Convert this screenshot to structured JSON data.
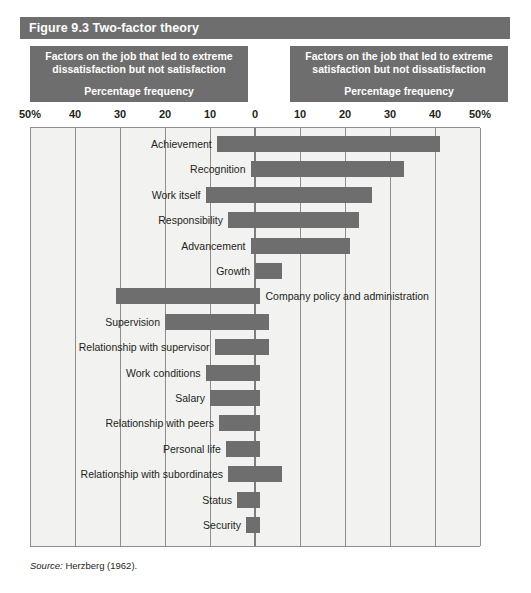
{
  "figure": {
    "title": "Figure 9.3 Two-factor theory",
    "source_prefix": "Source:",
    "source_text": " Herzberg (1962)."
  },
  "captions": {
    "left": {
      "line1": "Factors on the job that led to extreme",
      "line2": "dissatisfaction but not satisfaction",
      "sub": "Percentage frequency"
    },
    "right": {
      "line1": "Factors on the job that led to extreme",
      "line2": "satisfaction but not dissatisfaction",
      "sub": "Percentage frequency"
    }
  },
  "axis": {
    "ticks": [
      {
        "label": "50%",
        "value": -50
      },
      {
        "label": "40",
        "value": -40
      },
      {
        "label": "30",
        "value": -30
      },
      {
        "label": "20",
        "value": -20
      },
      {
        "label": "10",
        "value": -10
      },
      {
        "label": "0",
        "value": 0
      },
      {
        "label": "10",
        "value": 10
      },
      {
        "label": "20",
        "value": 20
      },
      {
        "label": "30",
        "value": 30
      },
      {
        "label": "40",
        "value": 40
      },
      {
        "label": "50%",
        "value": 50
      }
    ]
  },
  "colors": {
    "bar": "#6e6e6e",
    "header": "#6e6e6e",
    "plot_background": "#f2f2f0",
    "gridline": "#8d8d8d",
    "text": "#231f20"
  },
  "chart_data": {
    "type": "bar",
    "title": "Figure 9.3 Two-factor theory",
    "subtitle": "Herzberg's motivation-hygiene (two-factor) theory",
    "orientation": "horizontal-diverging",
    "xlabel": "Percentage frequency",
    "ylabel": "",
    "xlim": [
      -50,
      50
    ],
    "grid": true,
    "legend_position": "none",
    "left_axis_title": "Factors on the job that led to extreme dissatisfaction but not satisfaction",
    "right_axis_title": "Factors on the job that led to extreme satisfaction but not dissatisfaction",
    "note": "Each factor has a dissatisfaction (negative/left) and a satisfaction (positive/right) frequency; bar spans from -dissatisfaction to +satisfaction.",
    "categories": [
      "Achievement",
      "Recognition",
      "Work itself",
      "Responsibility",
      "Advancement",
      "Growth",
      "Company policy and administration",
      "Supervision",
      "Relationship with supervisor",
      "Work conditions",
      "Salary",
      "Relationship with peers",
      "Personal life",
      "Relationship with subordinates",
      "Status",
      "Security"
    ],
    "series": [
      {
        "name": "Dissatisfaction (left of zero)",
        "values": [
          8.5,
          1.0,
          11.0,
          6.0,
          1.0,
          0.0,
          31.0,
          20.0,
          9.0,
          11.0,
          10.0,
          8.0,
          6.5,
          6.0,
          4.0,
          2.0
        ]
      },
      {
        "name": "Satisfaction (right of zero)",
        "values": [
          41.0,
          33.0,
          26.0,
          23.0,
          21.0,
          6.0,
          1.0,
          3.0,
          3.0,
          1.0,
          1.0,
          1.0,
          1.0,
          0.0,
          1.0,
          1.0
        ]
      }
    ],
    "bars": [
      {
        "label": "Achievement",
        "start": -8.5,
        "end": 41.0,
        "label_side": "left"
      },
      {
        "label": "Recognition",
        "start": -1.0,
        "end": 33.0,
        "label_side": "left"
      },
      {
        "label": "Work itself",
        "start": -11.0,
        "end": 26.0,
        "label_side": "left"
      },
      {
        "label": "Responsibility",
        "start": -6.0,
        "end": 23.0,
        "label_side": "left"
      },
      {
        "label": "Advancement",
        "start": -1.0,
        "end": 21.0,
        "label_side": "left"
      },
      {
        "label": "Growth",
        "start": 0.0,
        "end": 6.0,
        "label_side": "left"
      },
      {
        "label": "Company policy and administration",
        "start": -31.0,
        "end": 1.0,
        "label_side": "right"
      },
      {
        "label": "Supervision",
        "start": -20.0,
        "end": 3.0,
        "label_side": "left"
      },
      {
        "label": "Relationship with supervisor",
        "start": -9.0,
        "end": 3.0,
        "label_side": "left"
      },
      {
        "label": "Work conditions",
        "start": -11.0,
        "end": 1.0,
        "label_side": "left"
      },
      {
        "label": "Salary",
        "start": -10.0,
        "end": 1.0,
        "label_side": "left"
      },
      {
        "label": "Relationship with peers",
        "start": -8.0,
        "end": 1.0,
        "label_side": "left"
      },
      {
        "label": "Personal life",
        "start": -6.5,
        "end": 1.0,
        "label_side": "left"
      },
      {
        "label": "Relationship with subordinates",
        "start": -6.0,
        "end": 6.0,
        "label_side": "left"
      },
      {
        "label": "Status",
        "start": -4.0,
        "end": 1.0,
        "label_side": "left"
      },
      {
        "label": "Security",
        "start": -2.0,
        "end": 1.0,
        "label_side": "left"
      }
    ]
  }
}
